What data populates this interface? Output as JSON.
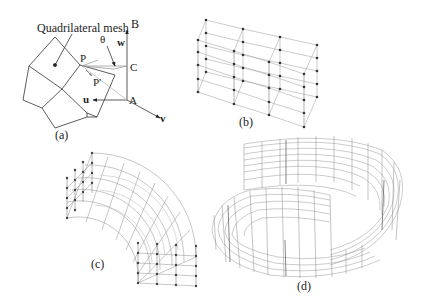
{
  "panels": {
    "a": {
      "caption": "(a)",
      "mesh_label": "Quadrilateral mesh",
      "points": {
        "P": "P",
        "P_prime": "P′",
        "A": "A",
        "B": "B",
        "C": "C"
      },
      "angle": "θ",
      "axes": {
        "u": "u",
        "v": "v",
        "w": "w"
      }
    },
    "b": {
      "caption": "(b)",
      "description": "3D lattice of control points with grid lines"
    },
    "c": {
      "caption": "(c)",
      "description": "Curved quarter-ring lattice mesh with control points"
    },
    "d": {
      "caption": "(d)",
      "description": "Spiral ring-shaped lattice mesh"
    }
  },
  "colors": {
    "ink": "#222222",
    "grid": "#9a9a9a",
    "faint": "#c8c8c8",
    "background": "#ffffff"
  }
}
